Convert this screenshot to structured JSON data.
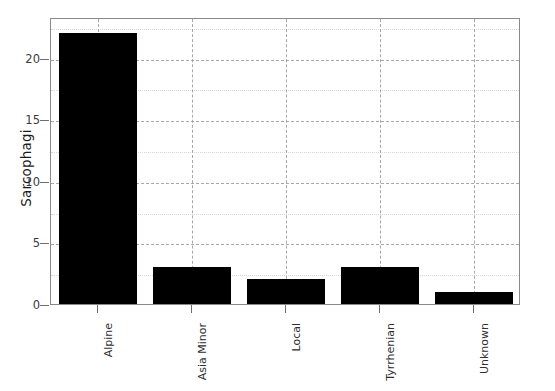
{
  "chart_data": {
    "type": "bar",
    "title": "",
    "xlabel": "",
    "ylabel": "Sarcophagi",
    "categories": [
      "Alpine",
      "Asia Minor",
      "Local",
      "Tyrrhenian",
      "Unknown"
    ],
    "values": [
      22,
      3,
      2,
      3,
      1
    ],
    "ylim": [
      0,
      23.3
    ],
    "yticks": [
      0,
      5,
      10,
      15,
      20
    ],
    "ytick_labels": [
      "0",
      "5",
      "10",
      "15",
      "20"
    ],
    "yminor_ticks": [
      2.5,
      7.5,
      12.5,
      17.5,
      22.5
    ],
    "grid": true,
    "grid_style": "dashed",
    "minor_grid": true,
    "legend": null,
    "bar_color": "#000000",
    "axes_color": "#8a8a8a",
    "grid_color": "#9a9a9a",
    "minor_grid_color": "#d5d5d5",
    "text_color": "#2e2e2e",
    "background": "#ffffff"
  }
}
